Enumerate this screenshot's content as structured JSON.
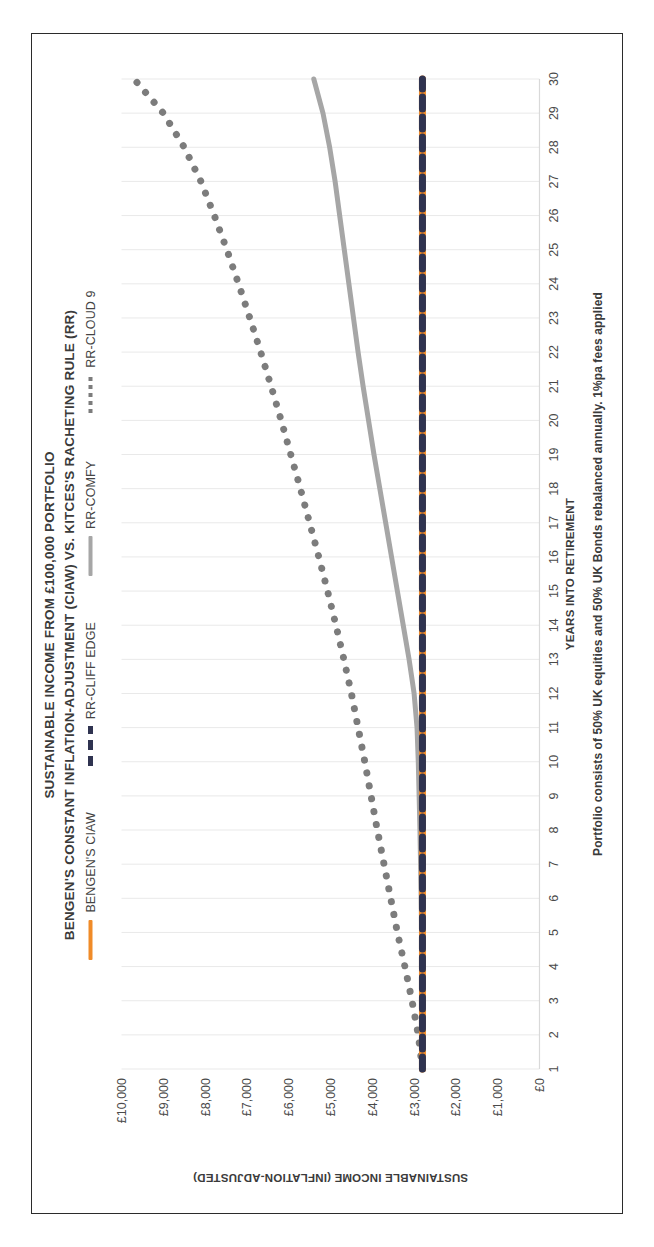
{
  "chart_data": {
    "type": "line",
    "title": "SUSTAINABLE INCOME FROM £100,000 PORTFOLIO",
    "subtitle": "BENGEN'S CONSTANT INFLATION-ADJUSTMENT (CIAW) VS. KITCES'S RACHETING RULE (RR)",
    "xlabel": "YEARS INTO RETIREMENT",
    "ylabel": "SUSTAINABLE INCOME (INFLATION-ADJUSTED)",
    "footnote": "Portfolio consists of 50% UK equities and 50% UK Bonds rebalanced annually.  1%pa fees applied",
    "grid": "vertical",
    "legend_position": "top",
    "xlim": [
      1,
      30
    ],
    "ylim": [
      0,
      10000
    ],
    "ytick_labels": [
      "£10,000",
      "£9,000",
      "£8,000",
      "£7,000",
      "£6,000",
      "£5,000",
      "£4,000",
      "£3,000",
      "£2,000",
      "£1,000",
      "£0"
    ],
    "ytick_values": [
      10000,
      9000,
      8000,
      7000,
      6000,
      5000,
      4000,
      3000,
      2000,
      1000,
      0
    ],
    "categories": [
      1,
      2,
      3,
      4,
      5,
      6,
      7,
      8,
      9,
      10,
      11,
      12,
      13,
      14,
      15,
      16,
      17,
      18,
      19,
      20,
      21,
      22,
      23,
      24,
      25,
      26,
      27,
      28,
      29,
      30
    ],
    "xtick_labels": [
      "1",
      "2",
      "3",
      "4",
      "5",
      "6",
      "7",
      "8",
      "9",
      "10",
      "11",
      "12",
      "13",
      "14",
      "15",
      "16",
      "17",
      "18",
      "19",
      "20",
      "21",
      "22",
      "23",
      "24",
      "25",
      "26",
      "27",
      "28",
      "29",
      "30"
    ],
    "series": [
      {
        "name": "BENGEN'S CIAW",
        "style": "solid",
        "color": "#F08B28",
        "values": [
          2800,
          2800,
          2800,
          2800,
          2800,
          2800,
          2800,
          2800,
          2800,
          2800,
          2800,
          2800,
          2800,
          2800,
          2800,
          2800,
          2800,
          2800,
          2800,
          2800,
          2800,
          2800,
          2800,
          2800,
          2800,
          2800,
          2800,
          2800,
          2800,
          2800
        ]
      },
      {
        "name": "RR-CLIFF EDGE",
        "style": "dashed",
        "color": "#2F3350",
        "values": [
          2800,
          2800,
          2800,
          2800,
          2800,
          2800,
          2800,
          2800,
          2800,
          2800,
          2800,
          2800,
          2800,
          2800,
          2800,
          2800,
          2800,
          2800,
          2800,
          2800,
          2800,
          2800,
          2800,
          2800,
          2800,
          2800,
          2800,
          2800,
          2800,
          2800
        ]
      },
      {
        "name": "RR-COMFY",
        "style": "solid",
        "color": "#A6A6A6",
        "values": [
          2800,
          2800,
          2800,
          2810,
          2820,
          2830,
          2845,
          2860,
          2880,
          2900,
          2930,
          3000,
          3120,
          3260,
          3400,
          3540,
          3680,
          3820,
          3960,
          4090,
          4220,
          4340,
          4450,
          4560,
          4670,
          4780,
          4890,
          5020,
          5180,
          5400
        ]
      },
      {
        "name": "RR-CLOUD 9",
        "style": "dotted",
        "color": "#7C7C7C",
        "values": [
          2800,
          2900,
          3050,
          3220,
          3400,
          3560,
          3720,
          3880,
          4030,
          4180,
          4340,
          4500,
          4680,
          4870,
          5070,
          5280,
          5500,
          5720,
          5950,
          6180,
          6420,
          6670,
          6930,
          7200,
          7480,
          7780,
          8100,
          8500,
          9000,
          9700
        ]
      }
    ]
  },
  "legend": [
    {
      "label": "BENGEN'S CIAW",
      "marker": "solid-line-swatch",
      "color": "#F08B28"
    },
    {
      "label": "RR-CLIFF EDGE",
      "marker": "dashed-line-swatch",
      "color": "#2F3350"
    },
    {
      "label": "RR-COMFY",
      "marker": "solid-line-swatch",
      "color": "#A6A6A6"
    },
    {
      "label": "RR-CLOUD 9",
      "marker": "dotted-line-swatch",
      "color": "#7C7C7C"
    }
  ]
}
